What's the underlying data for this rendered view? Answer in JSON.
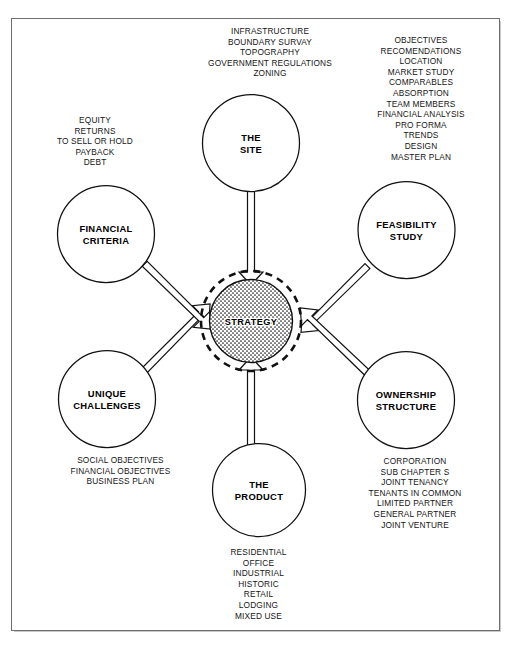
{
  "diagram": {
    "hub": {
      "label": "STRATEGY"
    },
    "nodes": [
      {
        "id": "the-site",
        "label": "THE\nSITE",
        "line1": "THE",
        "line2": "SITE"
      },
      {
        "id": "feasibility-study",
        "label": "FEASIBILITY\nSTUDY",
        "line1": "FEASIBILITY",
        "line2": "STUDY"
      },
      {
        "id": "ownership-structure",
        "label": "OWNERSHIP\nSTRUCTURE",
        "line1": "OWNERSHIP",
        "line2": "STRUCTURE"
      },
      {
        "id": "the-product",
        "label": "THE\nPRODUCT",
        "line1": "THE",
        "line2": "PRODUCT"
      },
      {
        "id": "unique-challenges",
        "label": "UNIQUE\nCHALLENGES",
        "line1": "UNIQUE",
        "line2": "CHALLENGES"
      },
      {
        "id": "financial-criteria",
        "label": "FINANCIAL\nCRITERIA",
        "line1": "FINANCIAL",
        "line2": "CRITERIA"
      }
    ],
    "annotations": {
      "the_site": "INFRASTRUCTURE\nBOUNDARY SURVAY\nTOPOGRAPHY\nGOVERNMENT REGULATIONS\nZONING",
      "feasibility_study": "OBJECTIVES\nRECOMENDATIONS\nLOCATION\nMARKET STUDY\nCOMPARABLES\nABSORPTION\nTEAM MEMBERS\nFINANCIAL ANALYSIS\nPRO FORMA\nTRENDS\nDESIGN\nMASTER PLAN",
      "financial_criteria": "EQUITY\nRETURNS\nTO SELL OR HOLD\nPAYBACK\nDEBT",
      "unique_challenges": "SOCIAL OBJECTIVES\nFINANCIAL OBJECTIVES\nBUSINESS PLAN",
      "ownership_structure": "CORPORATION\nSUB CHAPTER S\nJOINT TENANCY\nTENANTS IN COMMON\nLIMITED PARTNER\nGENERAL PARTNER\nJOINT VENTURE",
      "the_product": "RESIDENTIAL\nOFFICE\nINDUSTRIAL\nHISTORIC\nRETAIL\nLODGING\nMIXED USE"
    },
    "colors": {
      "ink": "#111111",
      "frame": "#6e6e6e",
      "background": "#ffffff"
    }
  }
}
